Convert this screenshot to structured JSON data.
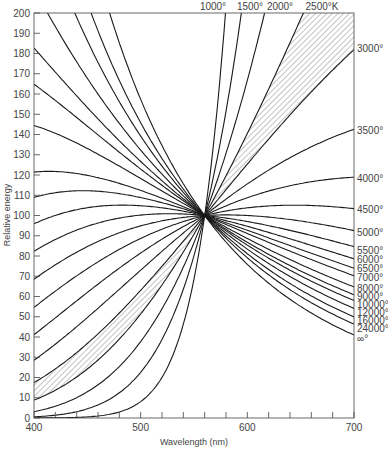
{
  "chart_data": {
    "type": "line",
    "title": "",
    "xlabel": "Wavelength (nm)",
    "ylabel": "Relative energy",
    "xlim": [
      400,
      700
    ],
    "ylim": [
      0,
      200
    ],
    "x_ticks": [
      400,
      500,
      600,
      700
    ],
    "x_minor_step": 20,
    "y_ticks": [
      0,
      10,
      20,
      30,
      40,
      50,
      60,
      70,
      80,
      90,
      100,
      110,
      120,
      130,
      140,
      150,
      160,
      170,
      180,
      190,
      200
    ],
    "grid": false,
    "normalization": {
      "wavelength_nm": 560,
      "value": 100
    },
    "top_labels": [
      "1000°",
      "1500°",
      "2000°",
      "2500°K"
    ],
    "right_labels": [
      "3000°",
      "3500°",
      "4000°",
      "4500°",
      "5000°",
      "5500°",
      "6000°",
      "6500°",
      "7000°",
      "8000°",
      "9000°",
      "10000°",
      "12000°",
      "16000°",
      "24000°",
      "∞°"
    ],
    "series": [
      {
        "name": "1000 K",
        "temperature_K": 1000
      },
      {
        "name": "1500 K",
        "temperature_K": 1500
      },
      {
        "name": "2000 K",
        "temperature_K": 2000
      },
      {
        "name": "2500 K",
        "temperature_K": 2500
      },
      {
        "name": "3000 K",
        "temperature_K": 3000,
        "value_at_700": 183
      },
      {
        "name": "3500 K",
        "temperature_K": 3500,
        "value_at_700": 142
      },
      {
        "name": "4000 K",
        "temperature_K": 4000,
        "value_at_700": 118
      },
      {
        "name": "4500 K",
        "temperature_K": 4500,
        "value_at_700": 103
      },
      {
        "name": "5000 K",
        "temperature_K": 5000,
        "value_at_700": 92
      },
      {
        "name": "5500 K",
        "temperature_K": 5500,
        "value_at_700": 83
      },
      {
        "name": "6000 K",
        "temperature_K": 6000,
        "value_at_700": 78
      },
      {
        "name": "6500 K",
        "temperature_K": 6500,
        "value_at_700": 74
      },
      {
        "name": "7000 K",
        "temperature_K": 7000,
        "value_at_700": 70
      },
      {
        "name": "8000 K",
        "temperature_K": 8000,
        "value_at_700": 64
      },
      {
        "name": "9000 K",
        "temperature_K": 9000,
        "value_at_700": 60
      },
      {
        "name": "10000 K",
        "temperature_K": 10000,
        "value_at_700": 56
      },
      {
        "name": "12000 K",
        "temperature_K": 12000,
        "value_at_700": 52
      },
      {
        "name": "16000 K",
        "temperature_K": 16000,
        "value_at_700": 48
      },
      {
        "name": "24000 K",
        "temperature_K": 24000,
        "value_at_700": 44
      },
      {
        "name": "∞ K",
        "temperature_K": 0,
        "value_at_700": 40
      }
    ],
    "left_intercepts_at_400": [
      184,
      165,
      145,
      123,
      110,
      96,
      83,
      69,
      55,
      41,
      28,
      17,
      9,
      3,
      0
    ],
    "hatched_bands": [
      {
        "between": [
          "2500 K",
          "3000 K"
        ],
        "side": "right of 560nm"
      },
      {
        "between": [
          "2500 K",
          "3000 K"
        ],
        "side": "left of 560nm"
      }
    ]
  }
}
